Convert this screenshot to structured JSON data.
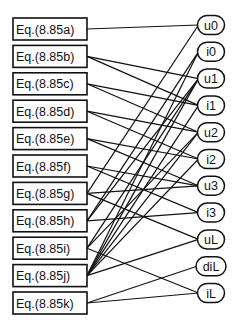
{
  "diagram": {
    "equations": [
      {
        "id": "a",
        "label": "Eq.(8.85a)"
      },
      {
        "id": "b",
        "label": "Eq.(8.85b)"
      },
      {
        "id": "c",
        "label": "Eq.(8.85c)"
      },
      {
        "id": "d",
        "label": "Eq.(8.85d)"
      },
      {
        "id": "e",
        "label": "Eq.(8.85e)"
      },
      {
        "id": "f",
        "label": "Eq.(8.85f)"
      },
      {
        "id": "g",
        "label": "Eq.(8.85g)"
      },
      {
        "id": "h",
        "label": "Eq.(8.85h)"
      },
      {
        "id": "i",
        "label": "Eq.(8.85i)"
      },
      {
        "id": "j",
        "label": "Eq.(8.85j)"
      },
      {
        "id": "k",
        "label": "Eq.(8.85k)"
      }
    ],
    "variables": [
      {
        "id": "u0",
        "label": "u0"
      },
      {
        "id": "i0",
        "label": "i0"
      },
      {
        "id": "u1",
        "label": "u1"
      },
      {
        "id": "i1",
        "label": "i1"
      },
      {
        "id": "u2",
        "label": "u2"
      },
      {
        "id": "i2",
        "label": "i2"
      },
      {
        "id": "u3",
        "label": "u3"
      },
      {
        "id": "i3",
        "label": "i3"
      },
      {
        "id": "uL",
        "label": "uL"
      },
      {
        "id": "diL",
        "label": "diL"
      },
      {
        "id": "iL",
        "label": "iL"
      }
    ],
    "edges": [
      [
        "a",
        "u0"
      ],
      [
        "b",
        "u1"
      ],
      [
        "b",
        "i1"
      ],
      [
        "c",
        "i1"
      ],
      [
        "c",
        "u2"
      ],
      [
        "d",
        "u2"
      ],
      [
        "d",
        "i2"
      ],
      [
        "e",
        "i2"
      ],
      [
        "e",
        "u3"
      ],
      [
        "f",
        "u3"
      ],
      [
        "f",
        "i3"
      ],
      [
        "g",
        "u0"
      ],
      [
        "g",
        "u3"
      ],
      [
        "g",
        "uL"
      ],
      [
        "h",
        "i0"
      ],
      [
        "h",
        "u1"
      ],
      [
        "h",
        "i3"
      ],
      [
        "i",
        "u1"
      ],
      [
        "i",
        "u2"
      ],
      [
        "i",
        "iL"
      ],
      [
        "j",
        "i0"
      ],
      [
        "j",
        "u1"
      ],
      [
        "j",
        "i1"
      ],
      [
        "j",
        "u2"
      ],
      [
        "j",
        "i2"
      ],
      [
        "j",
        "uL"
      ],
      [
        "k",
        "diL"
      ],
      [
        "k",
        "iL"
      ]
    ]
  }
}
